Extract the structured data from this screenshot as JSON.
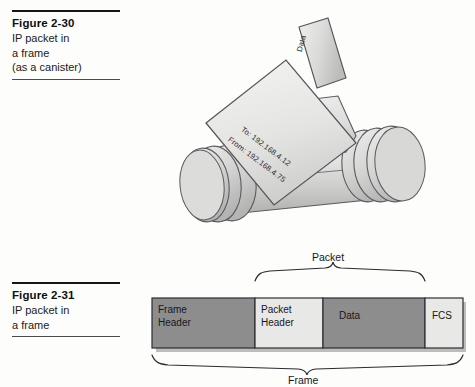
{
  "figures": [
    {
      "id": "figure-2-30",
      "title": "Figure 2-30",
      "lines": [
        "IP packet in",
        "a frame",
        "(as a canister)"
      ]
    },
    {
      "id": "figure-2-31",
      "title": "Figure 2-31",
      "lines": [
        "IP packet in",
        "a frame"
      ]
    }
  ],
  "canister": {
    "data_tab_label": "Data",
    "address_to": "To: 192.168.4.12",
    "address_from": "From: 192.168.4.75",
    "colors": {
      "body_light": "#e9e9e7",
      "body_mid": "#d2d2d0",
      "body_dark": "#b9b9b7",
      "outline": "#55555a"
    }
  },
  "frame_diagram": {
    "segments": [
      {
        "name": "frame-header",
        "label_lines": [
          "Frame",
          "Header"
        ],
        "tone": "dark"
      },
      {
        "name": "packet-header",
        "label_lines": [
          "Packet",
          "Header"
        ],
        "tone": "light"
      },
      {
        "name": "data",
        "label_lines": [
          "Data"
        ],
        "tone": "dark"
      },
      {
        "name": "fcs",
        "label_lines": [
          "FCS"
        ],
        "tone": "light"
      }
    ],
    "braces": [
      {
        "name": "packet-brace",
        "label": "Packet",
        "position": "top"
      },
      {
        "name": "frame-brace",
        "label": "Frame",
        "position": "bottom"
      }
    ],
    "colors": {
      "dark": "#8d8d8d",
      "light": "#e8e8e6",
      "outline": "#2e2e32",
      "shadow": "#b5b5b3"
    }
  }
}
